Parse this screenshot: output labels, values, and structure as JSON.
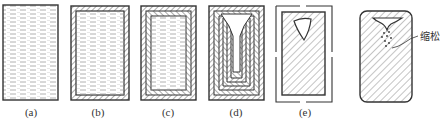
{
  "figure": {
    "panels": [
      {
        "id": "a",
        "label": "(a)",
        "state": "fully liquid"
      },
      {
        "id": "b",
        "label": "(b)",
        "state": "thin solid shell + liquid core"
      },
      {
        "id": "c",
        "label": "(c)",
        "state": "thicker layered shell + liquid core"
      },
      {
        "id": "d",
        "label": "(d)",
        "state": "nested solid layers, open funnel at top"
      },
      {
        "id": "e",
        "label": "(e)",
        "state": "fully solid with shrinkage cavity"
      },
      {
        "id": "f",
        "label": "",
        "state": "fully solid with funnel cavity and porosity"
      }
    ],
    "annotation": {
      "text": "缩松",
      "meaning": "shrinkage porosity"
    }
  },
  "colors": {
    "stroke": "#333333",
    "liquid_dash": "#9a9a9a",
    "hatch": "#444444",
    "background": "#ffffff"
  }
}
